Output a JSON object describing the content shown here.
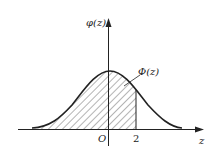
{
  "figure": {
    "y_axis_label": "φ(z)",
    "x_axis_label": "z",
    "origin_label": "O",
    "tick_label": "2",
    "area_label": "Φ(z)"
  },
  "colors": {
    "stroke": "#222222",
    "hatch": "#444444",
    "background": "#ffffff"
  }
}
